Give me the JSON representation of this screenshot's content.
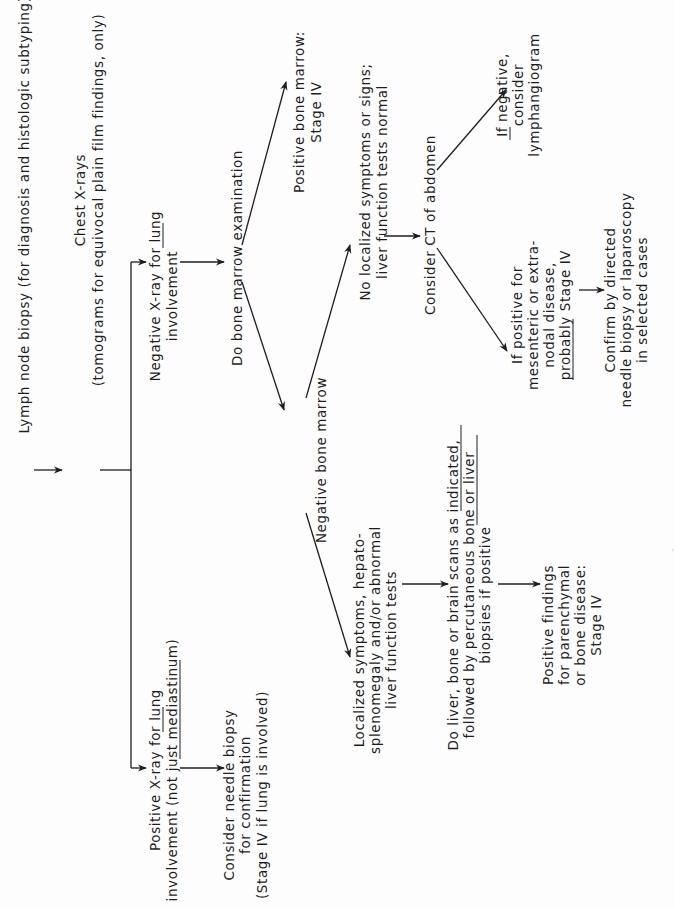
{
  "document": {
    "orientation": "rotated-90-ccw",
    "line_color": "#1e1e1e",
    "background": "#fdfdfd"
  },
  "flowchart": {
    "nodes": {
      "lymph_node_biopsy": {
        "lines": [
          "Lymph node biopsy (for diagnosis and histologic subtyping)"
        ]
      },
      "chest_xrays": {
        "lines": [
          "Chest X-rays",
          "(tomograms for equivocal plain film findings, only)"
        ]
      },
      "negative_xray": {
        "lines": [
          "Negative X-ray for lung",
          "involvement"
        ],
        "underlined": [
          "lung"
        ]
      },
      "positive_xray": {
        "lines": [
          "Positive X-ray for lung",
          "involvement (not just mediastinum)"
        ],
        "underlined": [
          "lung",
          "mediastinum"
        ]
      },
      "consider_needle_biopsy": {
        "lines": [
          "Consider needle biopsy",
          "for confirmation",
          "(Stage IV if lung is involved)"
        ]
      },
      "bone_marrow_exam": {
        "lines": [
          "Do bone marrow examination"
        ]
      },
      "positive_bone_marrow": {
        "lines": [
          "Positive bone marrow:",
          "Stage IV"
        ]
      },
      "negative_bone_marrow": {
        "lines": [
          "Negative bone marrow"
        ]
      },
      "no_localized_symptoms": {
        "lines": [
          "No localized symptoms or signs;",
          "liver function tests normal"
        ]
      },
      "localized_symptoms": {
        "lines": [
          "Localized symptoms, hepato-",
          "splenomegaly and/or abnormal",
          "liver function tests"
        ]
      },
      "consider_ct": {
        "lines": [
          "Consider CT of abdomen"
        ]
      },
      "if_negative": {
        "lines": [
          "If negative,",
          "consider",
          "lymphangiogram"
        ],
        "underlined": [
          "If"
        ]
      },
      "if_positive": {
        "lines": [
          "If positive for",
          "mesenteric or extra-",
          "nodal disease,",
          "probably Stage IV"
        ],
        "underlined": [
          "probably"
        ]
      },
      "confirm_by": {
        "lines": [
          "Confirm by directed",
          "needle biopsy or laparoscopy",
          "in selected cases"
        ]
      },
      "do_liver_scans": {
        "lines": [
          "Do liver, bone or brain scans as indicated,",
          "followed by percutaneous bone or liver",
          "biopsies if positive"
        ],
        "underlined": [
          "as indicated,",
          "bone or liver"
        ]
      },
      "positive_findings": {
        "lines": [
          "Positive findings",
          "for parenchymal",
          "or bone disease:",
          "Stage IV"
        ]
      }
    },
    "edges": [
      [
        "lymph_node_biopsy",
        "chest_xrays"
      ],
      [
        "chest_xrays",
        "negative_xray"
      ],
      [
        "chest_xrays",
        "positive_xray"
      ],
      [
        "positive_xray",
        "consider_needle_biopsy"
      ],
      [
        "negative_xray",
        "bone_marrow_exam"
      ],
      [
        "bone_marrow_exam",
        "positive_bone_marrow"
      ],
      [
        "bone_marrow_exam",
        "negative_bone_marrow"
      ],
      [
        "negative_bone_marrow",
        "no_localized_symptoms"
      ],
      [
        "negative_bone_marrow",
        "localized_symptoms"
      ],
      [
        "no_localized_symptoms",
        "consider_ct"
      ],
      [
        "consider_ct",
        "if_negative"
      ],
      [
        "consider_ct",
        "if_positive"
      ],
      [
        "if_positive",
        "confirm_by"
      ],
      [
        "localized_symptoms",
        "do_liver_scans"
      ],
      [
        "do_liver_scans",
        "positive_findings"
      ]
    ]
  }
}
